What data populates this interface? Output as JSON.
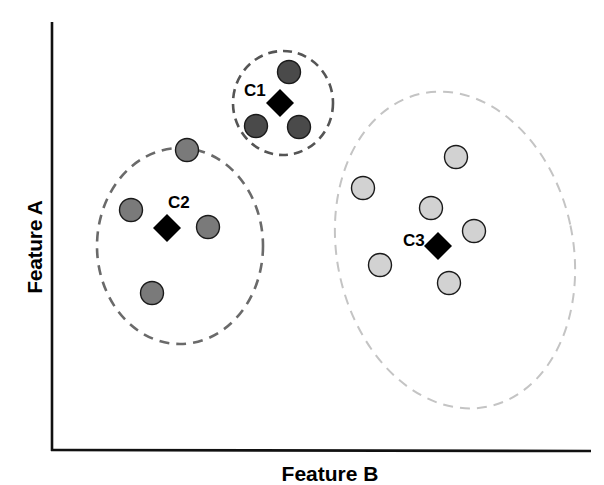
{
  "chart_data": {
    "type": "scatter",
    "title": "",
    "xlabel": "Feature B",
    "ylabel": "Feature A",
    "grid": false,
    "ticks": false,
    "clusters": [
      {
        "name": "C1",
        "color": "#4a4a4a",
        "boundary": {
          "style": "dashed",
          "color": "#555555",
          "cx": 283,
          "cy": 103,
          "rx": 50,
          "ry": 52,
          "rotate": 0
        },
        "centroid": {
          "x": 280,
          "y": 103
        },
        "label_pos": {
          "x": 244,
          "y": 96
        },
        "points": [
          {
            "x": 289,
            "y": 72
          },
          {
            "x": 256,
            "y": 126
          },
          {
            "x": 299,
            "y": 127
          }
        ]
      },
      {
        "name": "C2",
        "color": "#7a7a7a",
        "boundary": {
          "style": "dashed",
          "color": "#6a6a6a",
          "cx": 180,
          "cy": 246,
          "rx": 83,
          "ry": 98,
          "rotate": 0
        },
        "centroid": {
          "x": 167,
          "y": 228
        },
        "label_pos": {
          "x": 168,
          "y": 208
        },
        "points": [
          {
            "x": 187,
            "y": 150
          },
          {
            "x": 131,
            "y": 210
          },
          {
            "x": 208,
            "y": 227
          },
          {
            "x": 152,
            "y": 293
          }
        ]
      },
      {
        "name": "C3",
        "color": "#d2d2d2",
        "boundary": {
          "style": "dashed",
          "color": "#c4c4c4",
          "cx": 455,
          "cy": 250,
          "rx": 118,
          "ry": 160,
          "rotate": -12
        },
        "centroid": {
          "x": 438,
          "y": 246
        },
        "label_pos": {
          "x": 403,
          "y": 246
        },
        "points": [
          {
            "x": 456,
            "y": 157
          },
          {
            "x": 363,
            "y": 188
          },
          {
            "x": 431,
            "y": 208
          },
          {
            "x": 474,
            "y": 231
          },
          {
            "x": 380,
            "y": 265
          },
          {
            "x": 449,
            "y": 283
          }
        ]
      }
    ],
    "legend": null
  },
  "labels": {
    "y_axis": "Feature A",
    "x_axis": "Feature B",
    "c1": "C1",
    "c2": "C2",
    "c3": "C3"
  }
}
